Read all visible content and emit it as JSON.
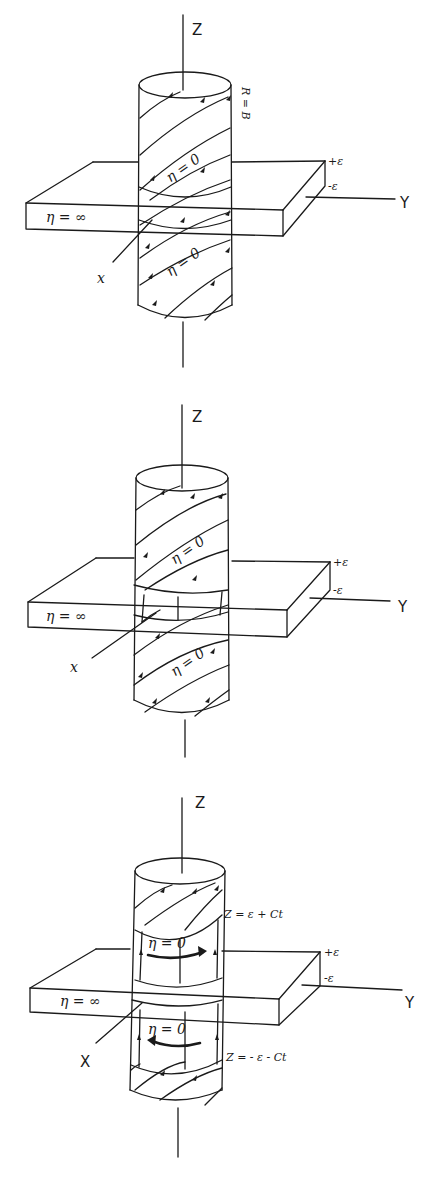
{
  "figure": {
    "panels": [
      {
        "id": "panel-1",
        "axes": {
          "z": "Z",
          "x": "x",
          "y": "Y"
        },
        "slab": {
          "label": "η = ∞",
          "top": "+ε",
          "bottom": "-ε"
        },
        "cylinder": {
          "upper_label": "η = 0",
          "lower_label": "η = 0",
          "side_label": "R = B"
        }
      },
      {
        "id": "panel-2",
        "axes": {
          "z": "Z",
          "x": "x",
          "y": "Y"
        },
        "slab": {
          "label": "η = ∞",
          "top": "+ε",
          "bottom": "-ε"
        },
        "cylinder": {
          "upper_label": "η = 0",
          "lower_label": "η = 0"
        }
      },
      {
        "id": "panel-3",
        "axes": {
          "z": "Z",
          "x": "X",
          "y": "Y"
        },
        "slab": {
          "label": "η = ∞",
          "top": "+ε",
          "bottom": "-ε"
        },
        "cylinder": {
          "upper_label": "η = 0",
          "lower_label": "η = 0",
          "upper_front": "Z = ε + Ct",
          "lower_front": "Z = - ε - Ct"
        }
      }
    ]
  }
}
